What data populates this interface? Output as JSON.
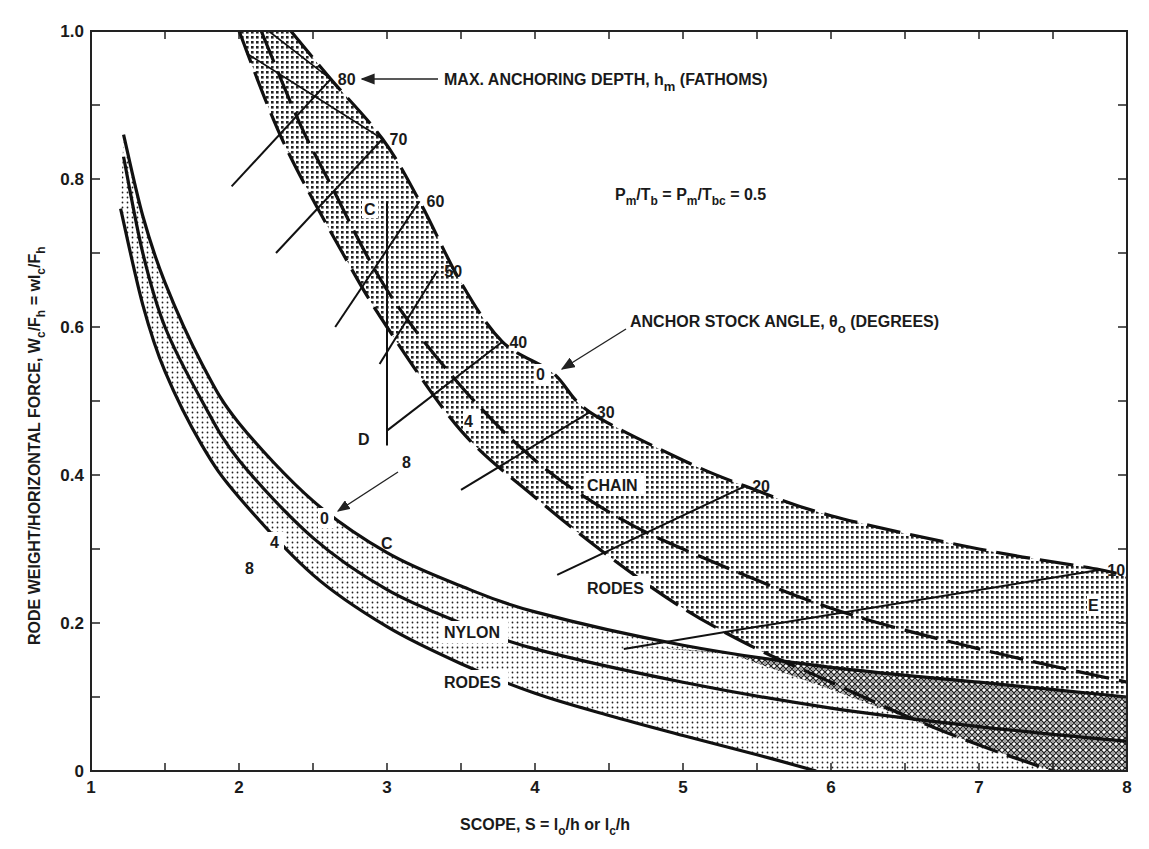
{
  "chart_data": {
    "type": "line",
    "title": "",
    "xlabel": "SCOPE, S = l_o/h or l_c/h",
    "ylabel": "RODE WEIGHT/HORIZONTAL FORCE, W_c/F_h = wl_c/F_h",
    "xlim": [
      1,
      8
    ],
    "ylim": [
      0,
      1.0
    ],
    "grid": false,
    "x_ticks": [
      1,
      2,
      3,
      4,
      5,
      6,
      7,
      8
    ],
    "x_tick_labels": [
      "1",
      "2",
      "3",
      "4",
      "5",
      "6",
      "7",
      "8"
    ],
    "y_ticks": [
      0,
      0.2,
      0.4,
      0.6,
      0.8,
      1.0
    ],
    "y_tick_labels": [
      "0",
      "0.2",
      "0.4",
      "0.6",
      "0.8",
      "1.0"
    ],
    "series": [
      {
        "name": "Chain rodes, θo = 0°",
        "group": "chain",
        "style": "dashed",
        "x": [
          2.35,
          2.62,
          2.97,
          3.22,
          3.5,
          3.78,
          4.12,
          4.37,
          5.0,
          5.42,
          6.0,
          7.0,
          7.82,
          8.0
        ],
        "y": [
          1.0,
          0.935,
          0.854,
          0.77,
          0.66,
          0.58,
          0.538,
          0.485,
          0.42,
          0.385,
          0.345,
          0.3,
          0.272,
          0.262
        ]
      },
      {
        "name": "Chain rodes, θo = 4°",
        "group": "chain",
        "style": "dashed",
        "x": [
          2.15,
          2.4,
          2.6,
          3.0,
          3.5,
          4.0,
          4.5,
          5.0,
          6.0,
          7.0,
          8.0
        ],
        "y": [
          1.0,
          0.88,
          0.8,
          0.65,
          0.52,
          0.42,
          0.35,
          0.3,
          0.22,
          0.165,
          0.12
        ]
      },
      {
        "name": "Chain rodes, θo = 8°",
        "group": "chain",
        "style": "dashed",
        "x": [
          2.0,
          2.3,
          2.7,
          3.0,
          3.5,
          4.0,
          4.5,
          5.0,
          5.5,
          6.0,
          6.5,
          7.0,
          7.5
        ],
        "y": [
          1.0,
          0.85,
          0.7,
          0.6,
          0.46,
          0.37,
          0.29,
          0.22,
          0.165,
          0.12,
          0.075,
          0.035,
          0.0
        ]
      },
      {
        "name": "Nylon rodes, θo = 0°",
        "group": "nylon",
        "style": "solid",
        "x": [
          1.22,
          1.35,
          1.5,
          1.75,
          2.0,
          2.5,
          3.0,
          3.5,
          4.0,
          5.0,
          6.0,
          7.0,
          8.0
        ],
        "y": [
          0.86,
          0.75,
          0.66,
          0.55,
          0.47,
          0.365,
          0.295,
          0.25,
          0.215,
          0.17,
          0.14,
          0.12,
          0.1
        ]
      },
      {
        "name": "Nylon rodes, θo = 4°",
        "group": "nylon",
        "style": "solid",
        "x": [
          1.22,
          1.35,
          1.5,
          1.75,
          2.0,
          2.5,
          3.0,
          3.5,
          4.0,
          5.0,
          6.0,
          7.0,
          8.0
        ],
        "y": [
          0.83,
          0.7,
          0.6,
          0.5,
          0.42,
          0.315,
          0.245,
          0.2,
          0.165,
          0.12,
          0.085,
          0.06,
          0.04
        ]
      },
      {
        "name": "Nylon rodes, θo = 8°",
        "group": "nylon",
        "style": "solid",
        "x": [
          1.2,
          1.35,
          1.5,
          1.75,
          2.0,
          2.5,
          3.0,
          3.5,
          4.0,
          4.5,
          5.0,
          5.5,
          5.9
        ],
        "y": [
          0.76,
          0.63,
          0.54,
          0.44,
          0.37,
          0.265,
          0.195,
          0.145,
          0.105,
          0.075,
          0.048,
          0.022,
          0.0
        ]
      }
    ],
    "depth_lines": [
      {
        "label": "80",
        "x": [
          2.62,
          1.95
        ],
        "y": [
          0.935,
          0.79
        ]
      },
      {
        "label": "70",
        "x": [
          2.97,
          2.25
        ],
        "y": [
          0.854,
          0.7
        ]
      },
      {
        "label": "60",
        "x": [
          3.22,
          2.65
        ],
        "y": [
          0.77,
          0.6
        ]
      },
      {
        "label": "50",
        "x": [
          3.34,
          2.95
        ],
        "y": [
          0.676,
          0.55
        ]
      },
      {
        "label": "40",
        "x": [
          3.78,
          3.0
        ],
        "y": [
          0.58,
          0.46
        ]
      },
      {
        "label": "30",
        "x": [
          4.37,
          3.5
        ],
        "y": [
          0.485,
          0.38
        ]
      },
      {
        "label": "20",
        "x": [
          5.42,
          4.15
        ],
        "y": [
          0.385,
          0.265
        ]
      },
      {
        "label": "10",
        "x": [
          7.82,
          4.6
        ],
        "y": [
          0.272,
          0.165
        ]
      }
    ],
    "line_CD": {
      "x": [
        3.0,
        3.0
      ],
      "y": [
        0.77,
        0.44
      ]
    },
    "annotations": [
      {
        "text": "MAX. ANCHORING DEPTH, h_m (FATHOMS)",
        "x": 4.55,
        "y": 0.935,
        "arrow_to": [
          2.7,
          0.935
        ]
      },
      {
        "text": "P_m/T_b = P_m/T_bc = 0.5",
        "x": 5.7,
        "y": 0.775
      },
      {
        "text": "ANCHOR STOCK ANGLE, θ_o (DEGREES)",
        "x": 4.65,
        "y": 0.6,
        "arrow_to": [
          4.15,
          0.55
        ]
      },
      {
        "text": "CHAIN",
        "x": 4.55,
        "y": 0.385
      },
      {
        "text": "RODES",
        "x": 4.55,
        "y": 0.245
      },
      {
        "text": "NYLON",
        "x": 3.55,
        "y": 0.185
      },
      {
        "text": "RODES",
        "x": 3.55,
        "y": 0.115
      },
      {
        "text": "C",
        "x": 2.9,
        "y": 0.755
      },
      {
        "text": "D",
        "x": 2.85,
        "y": 0.44
      },
      {
        "text": "C",
        "x": 3.0,
        "y": 0.3
      },
      {
        "text": "E",
        "x": 7.85,
        "y": 0.2
      },
      {
        "text": "0",
        "x": 4.12,
        "y": 0.52,
        "note": "chain θo=0"
      },
      {
        "text": "4",
        "x": 3.55,
        "y": 0.465,
        "note": "chain θo=4"
      },
      {
        "text": "8",
        "x": 3.15,
        "y": 0.415,
        "note": "chain θo=8",
        "arrow_to": [
          2.7,
          0.355
        ]
      },
      {
        "text": "0",
        "x": 2.6,
        "y": 0.35,
        "note": "nylon θo=0"
      },
      {
        "text": "4",
        "x": 2.2,
        "y": 0.32,
        "note": "nylon θo=4"
      },
      {
        "text": "8",
        "x": 1.95,
        "y": 0.305,
        "note": "nylon θo=8"
      }
    ],
    "depth_labels": [
      "80",
      "70",
      "60",
      "50",
      "40",
      "30",
      "20",
      "10"
    ]
  },
  "labels": {
    "x_axis": "SCOPE, S = l",
    "x_axis_sub1": "o",
    "x_axis_mid": "/h or l",
    "x_axis_sub2": "c",
    "x_axis_end": "/h",
    "y_axis_a": "RODE WEIGHT/HORIZONTAL FORCE, W",
    "y_axis_sub1": "c",
    "y_axis_b": "/F",
    "y_axis_sub2": "h",
    "y_axis_c": " = wl",
    "y_axis_sub3": "c",
    "y_axis_d": "/F",
    "y_axis_sub4": "h",
    "max_depth_a": "MAX. ANCHORING DEPTH, h",
    "max_depth_sub": "m",
    "max_depth_b": " (FATHOMS)",
    "ratio_a": "P",
    "ratio_s1": "m",
    "ratio_b": "/T",
    "ratio_s2": "b",
    "ratio_c": " = P",
    "ratio_s3": "m",
    "ratio_d": "/T",
    "ratio_s4": "bc",
    "ratio_e": " = 0.5",
    "stock_a": "ANCHOR STOCK ANGLE, θ",
    "stock_sub": "o",
    "stock_b": " (DEGREES)",
    "chain": "CHAIN",
    "rodes1": "RODES",
    "nylon": "NYLON",
    "rodes2": "RODES",
    "C1": "C",
    "D": "D",
    "C2": "C",
    "E": "E",
    "chain0": "0",
    "chain4": "4",
    "chain8": "8",
    "nyl0": "0",
    "nyl4": "4",
    "nyl8": "8"
  }
}
